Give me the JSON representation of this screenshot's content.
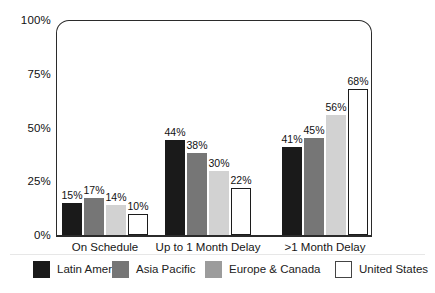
{
  "chart_data": {
    "type": "bar",
    "title": "",
    "categories": [
      "On Schedule",
      "Up to 1 Month Delay",
      ">1 Month Delay"
    ],
    "series": [
      {
        "name": "Latin America",
        "color": "#1a1a1a",
        "values": [
          15,
          44,
          41
        ]
      },
      {
        "name": "Asia Pacific",
        "color": "#767676",
        "values": [
          17,
          38,
          45
        ]
      },
      {
        "name": "Europe & Canada",
        "color": "#d2d2d2",
        "legend_swatch_color": "#9c9c9c",
        "values": [
          14,
          30,
          56
        ]
      },
      {
        "name": "United States",
        "color": "#ffffff",
        "outlined": true,
        "values": [
          10,
          22,
          68
        ]
      }
    ],
    "value_label_suffix": "%",
    "y_axis": {
      "min": 0,
      "max": 100,
      "ticks": [
        100,
        75,
        50,
        25,
        0
      ],
      "tick_suffix": "%"
    },
    "xlabel": "",
    "ylabel": "",
    "grid": false,
    "legend_position": "bottom",
    "frame_color": "#2b2b2b",
    "bar_outline_color": "#1c1c1c"
  }
}
